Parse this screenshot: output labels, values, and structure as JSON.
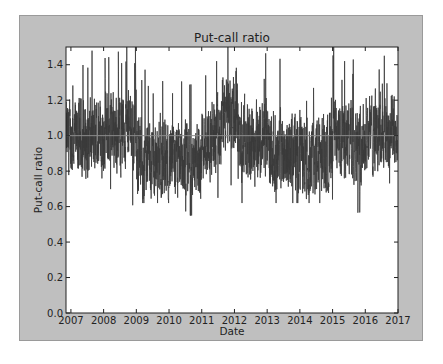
{
  "chart_data": {
    "type": "line",
    "title": "Put-call ratio",
    "xlabel": "Date",
    "ylabel": "Put-call ratio",
    "xlim": [
      2006.85,
      2017.0
    ],
    "ylim": [
      0.0,
      1.5
    ],
    "x_ticks": [
      "2007",
      "2008",
      "2009",
      "2010",
      "2011",
      "2012",
      "2013",
      "2014",
      "2015",
      "2016",
      "2017"
    ],
    "y_ticks": [
      "0.0",
      "0.2",
      "0.4",
      "0.6",
      "0.8",
      "1.0",
      "1.2",
      "1.4"
    ],
    "grid": false,
    "legend": null,
    "reference_line": {
      "y": 1.0,
      "color": "#8c8c8c"
    },
    "series": [
      {
        "name": "Put-call ratio",
        "color": "#3a3a3a",
        "frequency": "daily",
        "yearly_mean": [
          {
            "year": 2007,
            "mean": 0.98,
            "min": 0.6,
            "max": 1.5
          },
          {
            "year": 2008,
            "mean": 1.03,
            "min": 0.6,
            "max": 1.5
          },
          {
            "year": 2009,
            "mean": 0.86,
            "min": 0.62,
            "max": 1.2
          },
          {
            "year": 2010,
            "mean": 0.85,
            "min": 0.55,
            "max": 1.2
          },
          {
            "year": 2011,
            "mean": 0.98,
            "min": 0.58,
            "max": 1.5
          },
          {
            "year": 2012,
            "mean": 0.97,
            "min": 0.62,
            "max": 1.4
          },
          {
            "year": 2013,
            "mean": 0.92,
            "min": 0.62,
            "max": 1.25
          },
          {
            "year": 2014,
            "mean": 0.9,
            "min": 0.62,
            "max": 1.35
          },
          {
            "year": 2015,
            "mean": 0.98,
            "min": 0.55,
            "max": 1.5
          },
          {
            "year": 2016,
            "mean": 1.02,
            "min": 0.6,
            "max": 1.5
          }
        ]
      }
    ]
  },
  "colors": {
    "figure_bg": "#bfbfbf",
    "axes_bg": "#ffffff",
    "line": "#3a3a3a",
    "reference": "#8c8c8c"
  }
}
